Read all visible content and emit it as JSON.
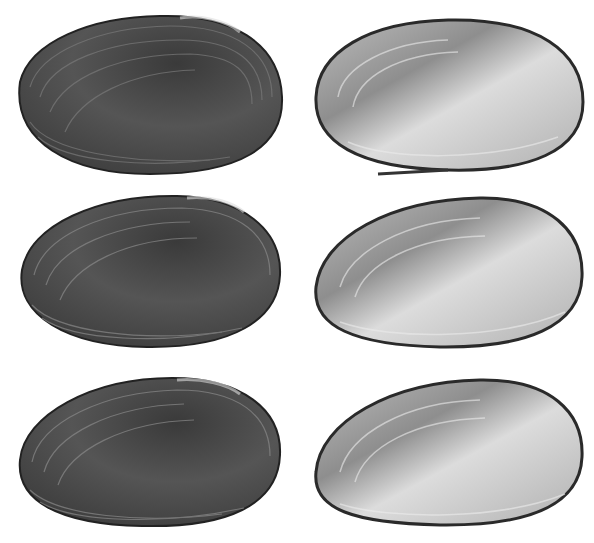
{
  "figure": {
    "background": "#ffffff",
    "layout": "3 rows x 2 columns",
    "panels": [
      {
        "row": 1,
        "column": 1,
        "view": "exterior",
        "subject": "mussel shell valve",
        "tone": "dark"
      },
      {
        "row": 1,
        "column": 2,
        "view": "interior",
        "subject": "mussel shell valve",
        "tone": "light nacre"
      },
      {
        "row": 2,
        "column": 1,
        "view": "exterior",
        "subject": "mussel shell valve",
        "tone": "dark"
      },
      {
        "row": 2,
        "column": 2,
        "view": "interior",
        "subject": "mussel shell valve",
        "tone": "light nacre"
      },
      {
        "row": 3,
        "column": 1,
        "view": "exterior",
        "subject": "mussel shell valve",
        "tone": "dark"
      },
      {
        "row": 3,
        "column": 2,
        "view": "interior",
        "subject": "mussel shell valve",
        "tone": "light nacre"
      }
    ],
    "colors": {
      "exterior_dark": "#2e2e2e",
      "exterior_mid": "#5a5a5a",
      "exterior_light": "#8a8a8a",
      "interior_light": "#d6d6d6",
      "interior_mid": "#a8a8a8",
      "interior_edge": "#2a2a2a"
    }
  }
}
